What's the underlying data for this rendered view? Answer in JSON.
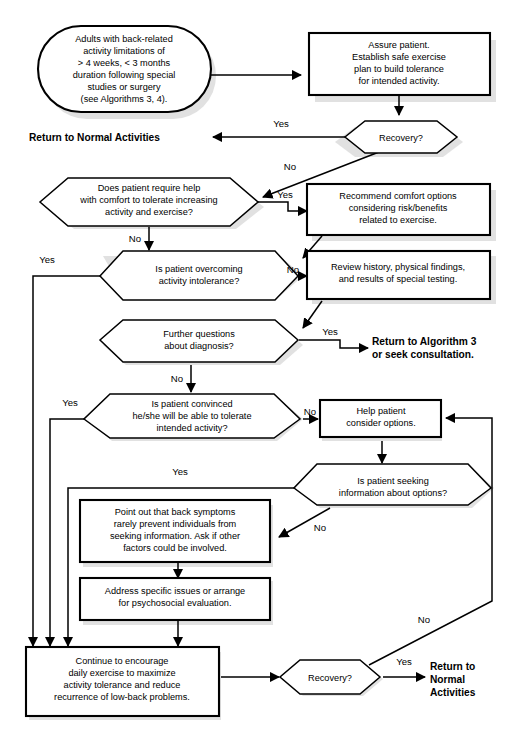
{
  "figure": {
    "caption": ""
  },
  "nodes": {
    "start": {
      "shape": "rounded-terminal",
      "lines": [
        "Adults with back-related",
        "activity limitations of",
        "> 4 weeks, < 3 months",
        "duration following special",
        "studies or surgery",
        "(see Algorithms 3, 4)."
      ]
    },
    "assure": {
      "shape": "process",
      "lines": [
        "Assure patient.",
        "Establish safe exercise",
        "plan to build tolerance",
        "for intended activity."
      ]
    },
    "recovery1": {
      "shape": "decision",
      "lines": [
        "Recovery?"
      ]
    },
    "require_help": {
      "shape": "decision",
      "lines": [
        "Does patient require help",
        "with comfort to tolerate increasing",
        "activity and exercise?"
      ]
    },
    "comfort_options": {
      "shape": "process",
      "lines": [
        "Recommend comfort options",
        "considering risk/benefits",
        "related to exercise."
      ]
    },
    "overcoming": {
      "shape": "decision",
      "lines": [
        "Is patient overcoming",
        "activity intolerance?"
      ]
    },
    "review_history": {
      "shape": "process",
      "lines": [
        "Review history, physical findings,",
        "and results of special testing."
      ]
    },
    "further_questions": {
      "shape": "decision",
      "lines": [
        "Further questions",
        "about diagnosis?"
      ]
    },
    "convinced": {
      "shape": "decision",
      "lines": [
        "Is patient convinced",
        "he/she will be able to tolerate",
        "intended activity?"
      ]
    },
    "help_consider": {
      "shape": "process",
      "lines": [
        "Help patient",
        "consider options."
      ]
    },
    "seeking_info": {
      "shape": "decision",
      "lines": [
        "Is patient seeking",
        "information about options?"
      ]
    },
    "point_out": {
      "shape": "process",
      "lines": [
        "Point out that back symptoms",
        "rarely prevent individuals from",
        "seeking information. Ask if other",
        "factors could be involved."
      ]
    },
    "address_issues": {
      "shape": "process",
      "lines": [
        "Address specific issues or arrange",
        "for psychosocial evaluation."
      ]
    },
    "continue_encourage": {
      "shape": "process",
      "lines": [
        "Continue to encourage",
        "daily exercise to maximize",
        "activity tolerance and reduce",
        "recurrence of low-back problems."
      ]
    },
    "recovery2": {
      "shape": "decision",
      "lines": [
        "Recovery?"
      ]
    }
  },
  "terminals": {
    "return_normal_top": {
      "lines": [
        "Return to Normal Activities"
      ]
    },
    "return_algorithm3": {
      "lines": [
        "Return to Algorithm 3",
        "or seek consultation."
      ]
    },
    "return_normal_bottom": {
      "lines": [
        "Return to",
        "Normal",
        "Activities"
      ]
    }
  },
  "edge_labels": {
    "recovery1_yes": "Yes",
    "recovery1_no": "No",
    "require_help_yes": "Yes",
    "require_help_no": "No",
    "overcoming_yes": "Yes",
    "overcoming_no": "No",
    "further_questions_yes": "Yes",
    "further_questions_no": "No",
    "convinced_yes": "Yes",
    "convinced_no": "No",
    "seeking_info_yes": "Yes",
    "seeking_info_no": "No",
    "recovery2_yes": "Yes",
    "recovery2_no": "No"
  },
  "colors": {
    "stroke": "#000000",
    "fill": "#ffffff",
    "shadow": "#c9c9c9",
    "background": "#ffffff"
  }
}
